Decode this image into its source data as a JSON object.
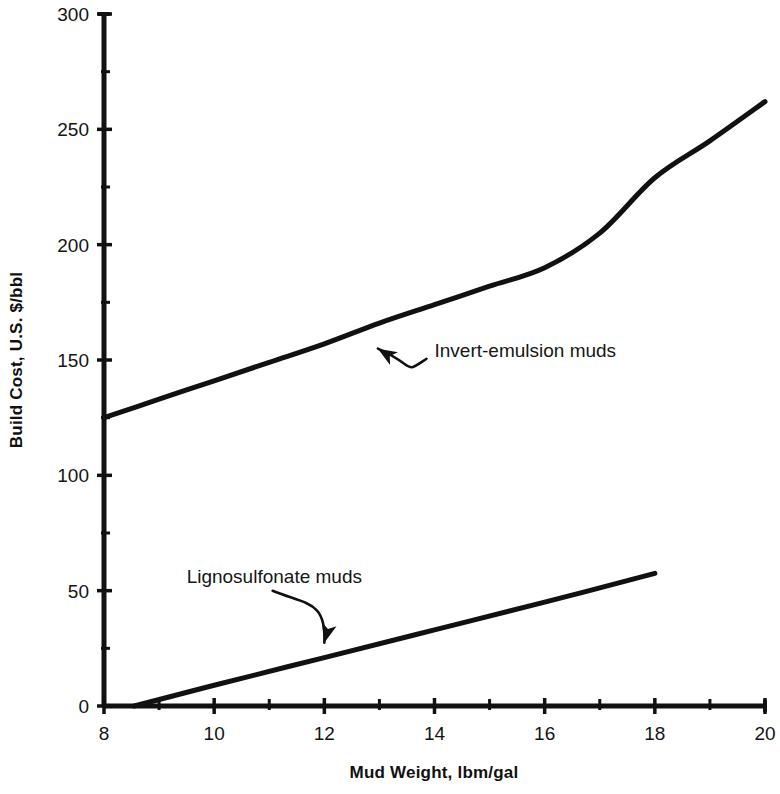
{
  "chart_data": {
    "type": "line",
    "title": "",
    "subtitle": "",
    "xlabel": "Mud Weight, lbm/gal",
    "ylabel": "Build Cost, U.S. $/bbl",
    "xlim": [
      8,
      20
    ],
    "ylim": [
      0,
      300
    ],
    "x_major_ticks": [
      8,
      10,
      12,
      14,
      16,
      18,
      20
    ],
    "x_tick_labels": [
      "8",
      "10",
      "12",
      "14",
      "16",
      "18",
      "20"
    ],
    "x_minor_ticks": [
      9,
      11,
      13,
      15,
      17,
      19
    ],
    "y_major_ticks": [
      0,
      50,
      100,
      150,
      200,
      250,
      300
    ],
    "y_tick_labels": [
      "0",
      "50",
      "100",
      "150",
      "200",
      "250",
      "300"
    ],
    "y_minor_ticks": [
      25,
      75,
      125,
      175,
      225,
      275
    ],
    "grid": false,
    "legend": "none",
    "line_color": "#111111",
    "axis_color": "#111111",
    "background_color": "#ffffff",
    "series": [
      {
        "name": "Invert-emulsion muds",
        "x": [
          8,
          9,
          10,
          11,
          12,
          13,
          14,
          15,
          16,
          17,
          18,
          19,
          20
        ],
        "values": [
          125,
          133,
          141,
          149,
          157,
          166,
          174,
          182,
          190,
          205,
          229,
          245,
          262
        ]
      },
      {
        "name": "Lignosulfonate muds",
        "x": [
          8.55,
          10,
          12,
          14,
          16,
          18
        ],
        "values": [
          0,
          9,
          21,
          33,
          45,
          57.5
        ]
      }
    ],
    "annotations": [
      {
        "name": "invert-emulsion-annotation",
        "text": "Invert-emulsion muds",
        "text_x": 14.0,
        "text_y": 154,
        "arrow_target_x": 12.9,
        "arrow_target_y": 161
      },
      {
        "name": "lignosulfonate-annotation",
        "text": "Lignosulfonate muds",
        "text_x": 9.5,
        "text_y": 56,
        "arrow_target_x": 12.0,
        "arrow_target_y": 24
      }
    ]
  }
}
